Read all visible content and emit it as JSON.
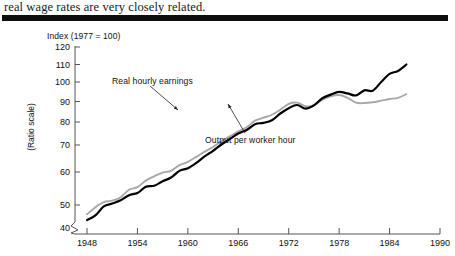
{
  "caption": {
    "text": "real wage rates are very closely related."
  },
  "divider": {
    "name": "thick-rule",
    "color": "#0d0d0d"
  },
  "chart_data": {
    "type": "line",
    "title": "",
    "index_note": "Index (1977 = 100)",
    "ylabel": "(Ratio scale)",
    "xlabel": "",
    "scale": "log",
    "grid": false,
    "legend_position": "inline-annotations",
    "xlim": [
      1948,
      1990
    ],
    "ylim": [
      40,
      120
    ],
    "yticks": [
      40,
      50,
      60,
      70,
      80,
      90,
      100,
      110,
      120
    ],
    "ytick_labels": [
      "40",
      "50",
      "60",
      "70",
      "80",
      "90",
      "100",
      "110",
      "120"
    ],
    "xticks": [
      1948,
      1954,
      1960,
      1966,
      1972,
      1978,
      1984,
      1990
    ],
    "xtick_labels": [
      "1948",
      "1954",
      "1960",
      "1966",
      "1972",
      "1978",
      "1984",
      "1990"
    ],
    "axis_break": true,
    "annotations": [
      {
        "label": "Real hourly earnings",
        "series": "Real hourly earnings",
        "x": 1956.5,
        "y": 86
      },
      {
        "label": "Output per worker hour",
        "series": "Output per worker hour",
        "x": 1969.5,
        "y": 62
      }
    ],
    "x": [
      1948,
      1949,
      1950,
      1951,
      1952,
      1953,
      1954,
      1955,
      1956,
      1957,
      1958,
      1959,
      1960,
      1961,
      1962,
      1963,
      1964,
      1965,
      1966,
      1967,
      1968,
      1969,
      1970,
      1971,
      1972,
      1973,
      1974,
      1975,
      1976,
      1977,
      1978,
      1979,
      1980,
      1981,
      1982,
      1983,
      1984,
      1985,
      1986
    ],
    "series": [
      {
        "name": "Output per worker hour",
        "color": "#000000",
        "values": [
          46.0,
          47.2,
          49.6,
          50.4,
          51.3,
          52.8,
          53.4,
          55.3,
          55.6,
          57.0,
          58.2,
          60.4,
          61.3,
          63.2,
          65.6,
          67.7,
          70.2,
          72.5,
          74.8,
          76.4,
          79.0,
          79.6,
          80.8,
          84.0,
          86.6,
          88.2,
          86.4,
          88.0,
          91.6,
          93.4,
          94.8,
          94.0,
          93.0,
          95.6,
          95.4,
          100.0,
          104.5,
          106.2,
          110.0
        ]
      },
      {
        "name": "Real hourly earnings",
        "color": "#a8a8a8",
        "values": [
          47.5,
          49.4,
          50.8,
          51.2,
          52.2,
          54.4,
          55.2,
          57.2,
          58.6,
          59.8,
          60.4,
          62.4,
          63.6,
          65.4,
          67.4,
          69.2,
          71.6,
          73.6,
          75.8,
          77.6,
          80.6,
          82.0,
          83.4,
          85.8,
          88.8,
          89.4,
          87.6,
          88.2,
          90.8,
          92.6,
          93.2,
          91.8,
          89.4,
          89.2,
          89.6,
          90.4,
          91.2,
          91.8,
          93.6
        ]
      }
    ]
  }
}
